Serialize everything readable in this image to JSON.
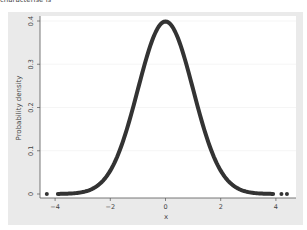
{
  "caption": "characterise is",
  "chart_data": {
    "type": "line",
    "title": "",
    "xlabel": "x",
    "ylabel": "Probability density",
    "xlim": [
      -4.4,
      4.6
    ],
    "ylim": [
      0,
      0.4
    ],
    "xticks": [
      -4,
      -2,
      0,
      2,
      4
    ],
    "xtick_labels": [
      "−4",
      "−2",
      "0",
      "2",
      "4"
    ],
    "yticks": [
      0,
      0.1,
      0.2,
      0.3,
      0.4
    ],
    "ytick_labels": [
      "0",
      "0.1",
      "0.2",
      "0.3",
      "0.4"
    ],
    "grid": true,
    "legend": null,
    "series": [
      {
        "name": "Standard normal density",
        "style": "markers (dense, forming thick curve)",
        "color": "#333333",
        "x": [
          -4.3,
          -3.9,
          -3.5,
          -3.0,
          -2.5,
          -2.0,
          -1.5,
          -1.0,
          -0.5,
          0.0,
          0.5,
          1.0,
          1.5,
          2.0,
          2.5,
          3.0,
          3.5,
          3.9,
          4.2,
          4.4
        ],
        "y": [
          4e-05,
          0.0002,
          0.0009,
          0.0044,
          0.0175,
          0.054,
          0.1295,
          0.242,
          0.352,
          0.399,
          0.352,
          0.242,
          0.1295,
          0.054,
          0.0175,
          0.0044,
          0.0009,
          0.0002,
          6e-05,
          3e-05
        ]
      }
    ],
    "colors": {
      "panel_bg": "#eaeaea",
      "plot_bg": "#ffffff",
      "curve": "#333333",
      "grid": "#eeeeee"
    }
  }
}
